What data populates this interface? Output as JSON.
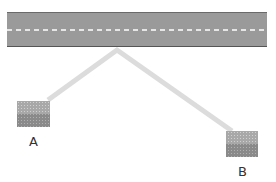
{
  "diagram": {
    "road": {
      "color": "#9a9a9a",
      "edge_color": "#666666",
      "center_line_color": "#ffffff"
    },
    "path": {
      "color": "#dcdcdc"
    },
    "houses": [
      {
        "label": "A"
      },
      {
        "label": "B"
      }
    ]
  }
}
